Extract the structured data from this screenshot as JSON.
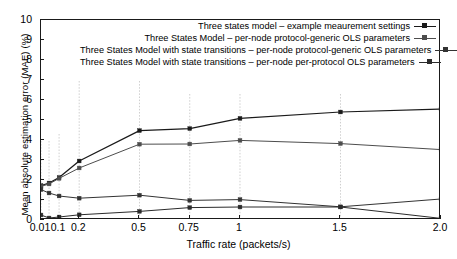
{
  "chart_data": {
    "type": "line",
    "title": "",
    "xlabel": "Traffic rate (packets/s)",
    "ylabel": "Mean absolute estimation error (MAE) (%)",
    "xlim": [
      0.01,
      2.0
    ],
    "ylim": [
      0,
      10
    ],
    "yticks": [
      0,
      1,
      2,
      3,
      4,
      5,
      6,
      7,
      8,
      9,
      10
    ],
    "xticks": [
      0.01,
      0.1,
      0.2,
      0.5,
      0.75,
      1,
      1.5,
      2.0
    ],
    "xticklabels": [
      "0.01",
      "0.1",
      "0.2",
      "0.5",
      "0.75",
      "1",
      "1.5",
      "2.0"
    ],
    "x": [
      0.01,
      0.05,
      0.1,
      0.2,
      0.5,
      0.75,
      1,
      1.5,
      2.0
    ],
    "grid": "vertical-dotted-light",
    "legend_position": "upper right",
    "series": [
      {
        "name": "Three states model – example meaurement settings",
        "color": "#1a1a1a",
        "marker": "square",
        "values": [
          1.72,
          1.85,
          2.12,
          2.95,
          4.47,
          4.57,
          5.08,
          5.4,
          5.55
        ]
      },
      {
        "name": "Three States Model – per-node protocol-generic OLS parameters",
        "color": "#4d4d4d",
        "marker": "square",
        "values": [
          1.68,
          1.8,
          2.08,
          2.6,
          3.79,
          3.8,
          3.98,
          3.82,
          3.52
        ]
      },
      {
        "name": "Three States Model with state transitions – per-node protocol-generic OLS parameters",
        "color": "#333333",
        "marker": "square",
        "values": [
          1.52,
          1.35,
          1.2,
          1.09,
          1.24,
          0.98,
          1.02,
          0.66,
          1.05
        ]
      },
      {
        "name": "Three States Model with state transitions – per-node per-protocol OLS parameters",
        "color": "#2b2b2b",
        "marker": "square",
        "values": [
          0.25,
          0.1,
          0.15,
          0.26,
          0.43,
          0.62,
          0.65,
          0.65,
          0.08
        ]
      }
    ],
    "errorbar_stems": [
      {
        "x": 0.01,
        "top": 3.95,
        "bottom": 0.0
      },
      {
        "x": 0.05,
        "top": 3.95,
        "bottom": 0.0
      },
      {
        "x": 0.1,
        "top": 4.3,
        "bottom": 0.0
      },
      {
        "x": 0.2,
        "top": 6.95,
        "bottom": 0.0
      },
      {
        "x": 0.5,
        "top": 6.95,
        "bottom": 0.0
      },
      {
        "x": 0.75,
        "top": 6.3,
        "bottom": 0.0
      },
      {
        "x": 1.0,
        "top": 6.3,
        "bottom": 0.0
      },
      {
        "x": 1.5,
        "top": 6.3,
        "bottom": 0.0
      },
      {
        "x": 2.0,
        "top": 6.3,
        "bottom": 0.0
      }
    ]
  },
  "axes": {
    "y_title": "Mean absolute estimation error (MAE) (%)",
    "x_title": "Traffic rate (packets/s)",
    "y_tick_labels": [
      "0",
      "1",
      "2",
      "3",
      "4",
      "5",
      "6",
      "7",
      "8",
      "9",
      "10"
    ],
    "x_tick_labels": [
      "0.01",
      "0.1",
      "0.2",
      "0.5",
      "0.75",
      "1",
      "1.5",
      "2.0"
    ]
  },
  "legend": {
    "entries": [
      "Three states model – example meaurement settings",
      "Three States Model – per-node protocol-generic OLS parameters",
      "Three States Model with state transitions – per-node protocol-generic OLS parameters",
      "Three States Model with state transitions – per-node per-protocol OLS parameters"
    ]
  }
}
